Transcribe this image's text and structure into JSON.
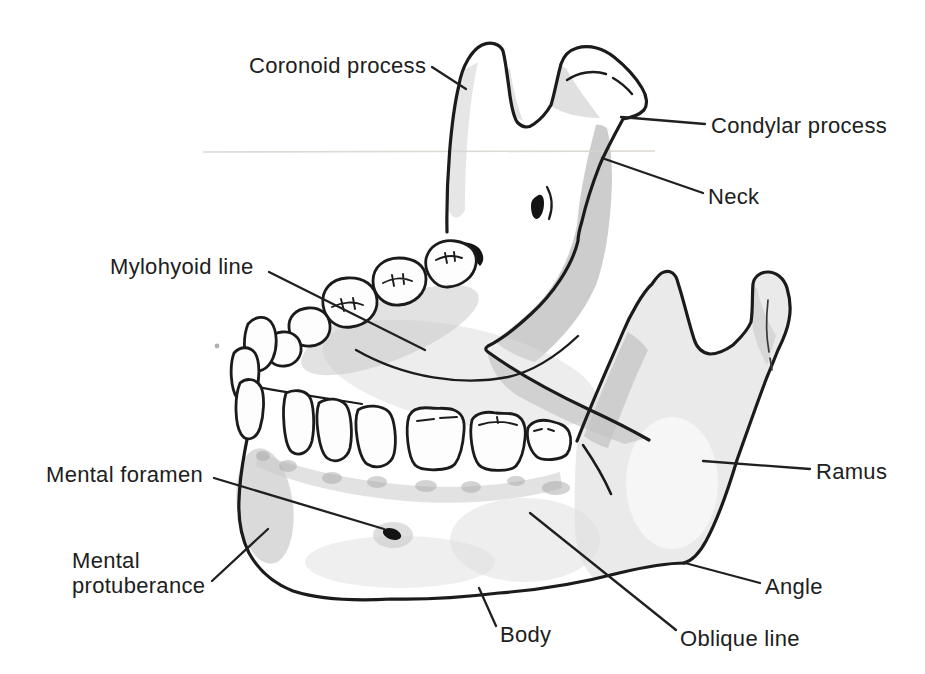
{
  "figure": {
    "labels": {
      "coronoid_process": "Coronoid process",
      "condylar_process": "Condylar process",
      "neck": "Neck",
      "mylohyoid_line": "Mylohyoid line",
      "mental_foramen": "Mental foramen",
      "mental_protuberance": "Mental protuberance",
      "body": "Body",
      "oblique_line": "Oblique line",
      "angle": "Angle",
      "ramus": "Ramus"
    },
    "colors": {
      "outline": "#1b1b1b",
      "label_text": "#202020",
      "shade_light": "#e3e3e3",
      "shade_medium": "#c2c2c2",
      "shade_dark": "#a8a8a8",
      "background": "#ffffff",
      "scan_artifact": "#d7d2cc"
    }
  }
}
